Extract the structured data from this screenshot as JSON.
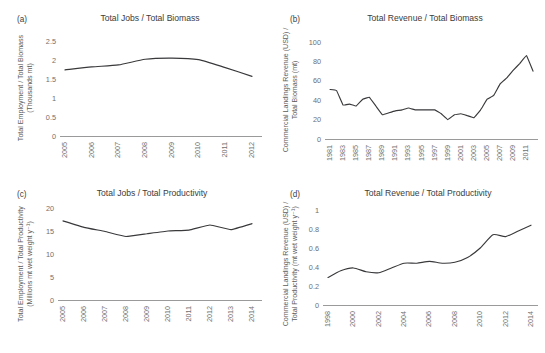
{
  "figure": {
    "background": "#ffffff",
    "line_color": "#39393c",
    "axis_color": "#9a9a9a",
    "text_color": "#3c3c3c"
  },
  "panels": [
    {
      "tag": "(a)",
      "title": "Total Jobs / Total Biomass",
      "ylabel_line1": "Total Employment / Total Biomass",
      "ylabel_line2": "(Thousands mt)"
    },
    {
      "tag": "(b)",
      "title": "Total Revenue / Total Biomass",
      "ylabel_line1": "Commercial Landings Revenue (USD) /",
      "ylabel_line2": "Total Biomass (mt)"
    },
    {
      "tag": "(c)",
      "title": "Total Jobs / Total Productivity",
      "ylabel_line1": "Total Employment / Total Productivity",
      "ylabel_line2": "(Millions mt wet weight y⁻¹)"
    },
    {
      "tag": "(d)",
      "title": "Total Revenue / Total Productivity",
      "ylabel_line1": "Commercial Landings Revenue (USD) /",
      "ylabel_line2": "Total Productivity (mt wet weight y⁻¹)"
    }
  ],
  "chart_data": [
    {
      "id": "a",
      "type": "line",
      "title": "Total Jobs / Total Biomass",
      "xlabel": "",
      "ylabel": "Total Employment / Total Biomass (Thousands mt)",
      "ylim": [
        0,
        2.5
      ],
      "yticks": [
        0,
        0.5,
        1,
        1.5,
        2,
        2.5
      ],
      "ytick_labels": [
        "0",
        "0.5",
        "1",
        "1.5",
        "2",
        "2.5"
      ],
      "xlim": [
        2005,
        2012
      ],
      "xticks": [
        2005,
        2006,
        2007,
        2008,
        2009,
        2010,
        2011,
        2012
      ],
      "xtick_labels": [
        "2005",
        "2006",
        "2007",
        "2008",
        "2009",
        "2010",
        "2011",
        "2012"
      ],
      "grid": false,
      "legend": "none",
      "x": [
        2005,
        2006,
        2007,
        2008,
        2009,
        2010,
        2011,
        2012
      ],
      "values": [
        1.74,
        1.82,
        1.87,
        2.02,
        2.05,
        2.01,
        1.8,
        1.57
      ]
    },
    {
      "id": "b",
      "type": "line",
      "title": "Total Revenue / Total Biomass",
      "xlabel": "",
      "ylabel": "Commercial Landings Revenue (USD) / Total Biomass (mt)",
      "ylim": [
        0,
        100
      ],
      "yticks": [
        0,
        20,
        40,
        60,
        80,
        100
      ],
      "ytick_labels": [
        "0",
        "20",
        "40",
        "60",
        "80",
        "100"
      ],
      "xlim": [
        1981,
        2012
      ],
      "xticks": [
        1981,
        1983,
        1985,
        1987,
        1989,
        1991,
        1993,
        1995,
        1997,
        1999,
        2001,
        2003,
        2005,
        2007,
        2009,
        2011
      ],
      "xtick_labels": [
        "1981",
        "1983",
        "1985",
        "1987",
        "1989",
        "1991",
        "1993",
        "1995",
        "1997",
        "1999",
        "2001",
        "2003",
        "2005",
        "2007",
        "2009",
        "2011"
      ],
      "grid": false,
      "legend": "none",
      "x": [
        1981,
        1982,
        1983,
        1984,
        1985,
        1986,
        1987,
        1988,
        1989,
        1990,
        1991,
        1992,
        1993,
        1994,
        1995,
        1996,
        1997,
        1998,
        1999,
        2000,
        2001,
        2002,
        2003,
        2004,
        2005,
        2006,
        2007,
        2008,
        2009,
        2010,
        2011,
        2012
      ],
      "values": [
        51,
        50,
        35,
        36,
        34,
        41,
        43,
        34,
        25,
        27,
        29,
        30,
        32,
        30,
        30,
        30,
        30,
        26,
        20,
        25,
        26,
        24,
        22,
        30,
        41,
        45,
        57,
        63,
        71,
        78,
        86,
        70
      ]
    },
    {
      "id": "c",
      "type": "line",
      "title": "Total Jobs / Total Productivity",
      "xlabel": "",
      "ylabel": "Total Employment / Total Productivity (Millions mt wet weight y⁻¹)",
      "ylim": [
        0,
        20
      ],
      "yticks": [
        0,
        5,
        10,
        15,
        20
      ],
      "ytick_labels": [
        "0",
        "5",
        "10",
        "15",
        "20"
      ],
      "xlim": [
        2005,
        2014
      ],
      "xticks": [
        2005,
        2006,
        2007,
        2008,
        2009,
        2010,
        2011,
        2012,
        2013,
        2014
      ],
      "xtick_labels": [
        "2005",
        "2006",
        "2007",
        "2008",
        "2009",
        "2010",
        "2011",
        "2012",
        "2013",
        "2014"
      ],
      "grid": false,
      "legend": "none",
      "x": [
        2005,
        2006,
        2007,
        2008,
        2009,
        2010,
        2011,
        2012,
        2013,
        2014
      ],
      "values": [
        17.2,
        15.8,
        14.9,
        13.8,
        14.4,
        15.0,
        15.2,
        16.3,
        15.3,
        16.6
      ]
    },
    {
      "id": "d",
      "type": "line",
      "title": "Total Revenue / Total Productivity",
      "xlabel": "",
      "ylabel": "Commercial Landings Revenue (USD) / Total Productivity (mt wet weight y⁻¹)",
      "ylim": [
        0,
        1
      ],
      "yticks": [
        0,
        0.2,
        0.4,
        0.6,
        0.8,
        1
      ],
      "ytick_labels": [
        "0",
        "0.2",
        "0.4",
        "0.6",
        "0.8",
        "1"
      ],
      "xlim": [
        1998,
        2014
      ],
      "xticks": [
        1998,
        2000,
        2002,
        2004,
        2006,
        2008,
        2010,
        2012,
        2014
      ],
      "xtick_labels": [
        "1998",
        "2000",
        "2002",
        "2004",
        "2006",
        "2008",
        "2010",
        "2012",
        "2014"
      ],
      "grid": false,
      "legend": "none",
      "x": [
        1998,
        1999,
        2000,
        2001,
        2002,
        2003,
        2004,
        2005,
        2006,
        2007,
        2008,
        2009,
        2010,
        2011,
        2012,
        2013,
        2014
      ],
      "values": [
        0.29,
        0.36,
        0.39,
        0.35,
        0.34,
        0.39,
        0.44,
        0.44,
        0.46,
        0.44,
        0.45,
        0.5,
        0.6,
        0.74,
        0.72,
        0.78,
        0.84
      ]
    }
  ]
}
